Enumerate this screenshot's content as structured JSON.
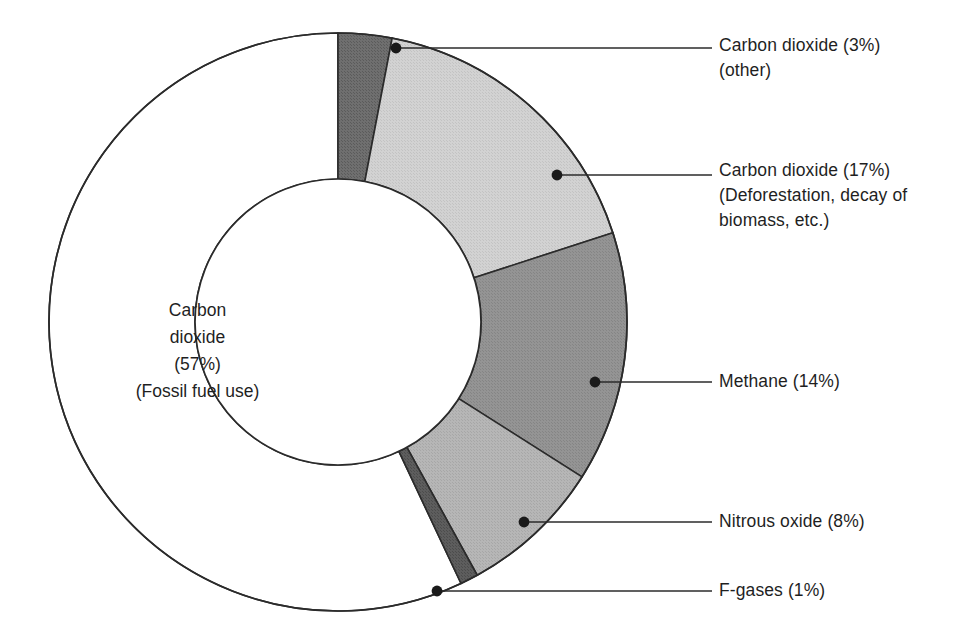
{
  "chart_data": {
    "type": "pie",
    "variant": "donut",
    "title": "",
    "subtitle": "",
    "xlabel": "",
    "ylabel": "",
    "legend_position": "callout-labels",
    "grid": false,
    "units": "percent",
    "total": 100,
    "categories": [
      "Carbon dioxide (Fossil fuel use)",
      "Carbon dioxide (other)",
      "Carbon dioxide (Deforestation, decay of biomass, etc.)",
      "Methane",
      "Nitrous oxide",
      "F-gases"
    ],
    "values": [
      57,
      3,
      17,
      14,
      8,
      1
    ],
    "slices": [
      {
        "key": "co2-fossil",
        "name": "Carbon dioxide",
        "qualifier": "(Fossil fuel use)",
        "value": 57,
        "value_label": "(57%)",
        "color": "#ffffff",
        "label_placement": "inside-center"
      },
      {
        "key": "co2-other",
        "name": "Carbon dioxide",
        "qualifier": "(other)",
        "value": 3,
        "value_label": "(3%)",
        "color": "#6f6f6f",
        "label_placement": "callout-right"
      },
      {
        "key": "co2-deforestation",
        "name": "Carbon dioxide",
        "qualifier": "(Deforestation, decay of biomass, etc.)",
        "value": 17,
        "value_label": "(17%)",
        "color": "#cfcfcf",
        "label_placement": "callout-right"
      },
      {
        "key": "methane",
        "name": "Methane",
        "qualifier": "",
        "value": 14,
        "value_label": "(14%)",
        "color": "#919191",
        "label_placement": "callout-right"
      },
      {
        "key": "nitrous-oxide",
        "name": "Nitrous oxide",
        "qualifier": "",
        "value": 8,
        "value_label": "(8%)",
        "color": "#b3b3b3",
        "label_placement": "callout-right"
      },
      {
        "key": "f-gases",
        "name": "F-gases",
        "qualifier": "",
        "value": 1,
        "value_label": "(1%)",
        "color": "#5a5a5a",
        "label_placement": "callout-right"
      }
    ]
  },
  "center_label": {
    "line1": "Carbon",
    "line2": "dioxide",
    "line3": "(57%)",
    "line4": "(Fossil fuel use)"
  },
  "callouts": {
    "co2_other": {
      "line1": "Carbon dioxide (3%)",
      "line2": "(other)"
    },
    "co2_deforestation": {
      "line1": "Carbon dioxide (17%)",
      "line2": "(Deforestation, decay of",
      "line3": "biomass, etc.)"
    },
    "methane": {
      "line1": "Methane (14%)"
    },
    "nitrous_oxide": {
      "line1": "Nitrous oxide (8%)"
    },
    "f_gases": {
      "line1": "F-gases (1%)"
    }
  },
  "style": {
    "background": "#ffffff",
    "text_color": "#1f1f1f",
    "stroke_color": "#2b2b2b",
    "leader_color": "#2b2b2b"
  }
}
